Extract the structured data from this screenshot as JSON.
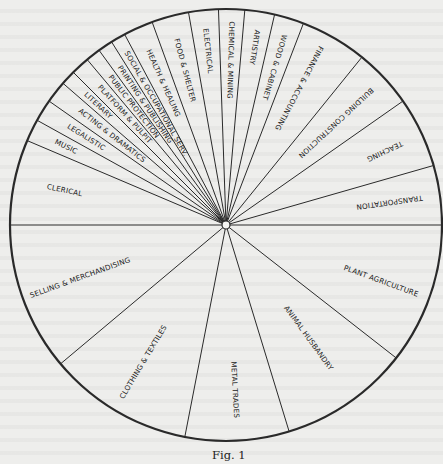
{
  "figure": {
    "caption": "Fig. 1",
    "center": [
      226,
      225
    ],
    "radius": 216,
    "colors": {
      "line": "#2a2a2a",
      "background": "#eeeeec",
      "text": "#222222"
    }
  },
  "segments": [
    {
      "label": "CLERICAL",
      "start": 180,
      "end": 203,
      "label_angle": 192,
      "label_r": 165,
      "flip": false
    },
    {
      "label": "MUSIC",
      "start": 203,
      "end": 209,
      "label_angle": 206,
      "label_r": 178,
      "flip": false
    },
    {
      "label": "LEGALISTIC",
      "start": 209,
      "end": 215,
      "label_angle": 212,
      "label_r": 165,
      "flip": false
    },
    {
      "label": "ACTING & DRAMATICS",
      "start": 215,
      "end": 221,
      "label_angle": 218,
      "label_r": 145,
      "flip": false
    },
    {
      "label": "LITERARY",
      "start": 221,
      "end": 225,
      "label_angle": 223,
      "label_r": 175,
      "flip": false
    },
    {
      "label": "PLATFORM & PULPIT",
      "start": 225,
      "end": 230,
      "label_angle": 227.5,
      "label_r": 150,
      "flip": false
    },
    {
      "label": "PUBLIC PROTECTION",
      "start": 230,
      "end": 234,
      "label_angle": 232,
      "label_r": 150,
      "flip": false
    },
    {
      "label": "PRINTING & PUBLISHING",
      "start": 234,
      "end": 238,
      "label_angle": 236,
      "label_r": 145,
      "flip": false
    },
    {
      "label": "SOCIAL & OCCUPATIONAL SERV.",
      "start": 238,
      "end": 242,
      "label_angle": 240,
      "label_r": 140,
      "flip": false
    },
    {
      "label": "HEALTH & HEALING",
      "start": 242,
      "end": 250,
      "label_angle": 246,
      "label_r": 155,
      "flip": false
    },
    {
      "label": "FOOD & SHELTER",
      "start": 250,
      "end": 260,
      "label_angle": 255,
      "label_r": 160,
      "flip": false
    },
    {
      "label": "ELECTRICAL",
      "start": 260,
      "end": 268,
      "label_angle": 264,
      "label_r": 175,
      "flip": false
    },
    {
      "label": "CHEMICAL & MINING",
      "start": 268,
      "end": 275,
      "label_angle": 271.5,
      "label_r": 165,
      "flip": false
    },
    {
      "label": "ARTISTRY",
      "start": 275,
      "end": 283,
      "label_angle": 279,
      "label_r": 180,
      "flip": false
    },
    {
      "label": "WOOD & CABINET",
      "start": 283,
      "end": 291,
      "label_angle": 287,
      "label_r": 165,
      "flip": false
    },
    {
      "label": "FINANCE & ACCOUNTING",
      "start": 291,
      "end": 309,
      "label_angle": 298,
      "label_r": 155,
      "flip": false
    },
    {
      "label": "BUILDING CONSTRUCTION",
      "start": 309,
      "end": 325,
      "label_angle": 317,
      "label_r": 150,
      "flip": false
    },
    {
      "label": "TEACHING",
      "start": 325,
      "end": 344,
      "label_angle": 335,
      "label_r": 175,
      "flip": true
    },
    {
      "label": "TRANSPORTATION",
      "start": 344,
      "end": 360,
      "label_angle": 352,
      "label_r": 165,
      "flip": true
    },
    {
      "label": "PLANT AGRICULTURE",
      "start": 0,
      "end": 38,
      "label_angle": 20,
      "label_r": 165,
      "flip": false
    },
    {
      "label": "ANIMAL HUSBANDRY",
      "start": 38,
      "end": 73,
      "label_angle": 54,
      "label_r": 140,
      "flip": false
    },
    {
      "label": "METAL TRADES",
      "start": 73,
      "end": 101,
      "label_angle": 87,
      "label_r": 165,
      "flip": false
    },
    {
      "label": "CLOTHING & TEXTILES",
      "start": 101,
      "end": 140,
      "label_angle": 121,
      "label_r": 160,
      "flip": true
    },
    {
      "label": "SELLING & MERCHANDISING",
      "start": 140,
      "end": 180,
      "label_angle": 160,
      "label_r": 155,
      "flip": true
    }
  ]
}
